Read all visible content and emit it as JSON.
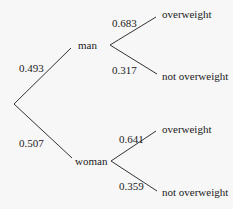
{
  "diagram": {
    "type": "probability tree",
    "root_branches": [
      {
        "probability": "0.493",
        "label": "man",
        "branches": [
          {
            "probability": "0.683",
            "label": "overweight"
          },
          {
            "probability": "0.317",
            "label": "not overweight"
          }
        ]
      },
      {
        "probability": "0.507",
        "label": "woman",
        "branches": [
          {
            "probability": "0.641",
            "label": "overweight"
          },
          {
            "probability": "0.359",
            "label": "not overweight"
          }
        ]
      }
    ]
  }
}
